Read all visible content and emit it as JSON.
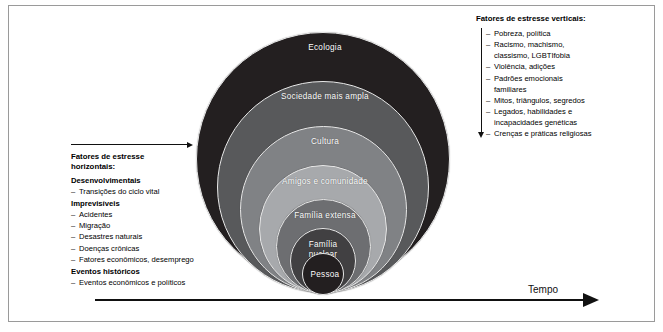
{
  "figure": {
    "rings": [
      {
        "id": "ecologia",
        "label": "Ecologia",
        "color": "#231f20"
      },
      {
        "id": "sociedade-mais-ampla",
        "label": "Sociedade mais ampla",
        "color": "#58595b"
      },
      {
        "id": "cultura",
        "label": "Cultura",
        "color": "#808285"
      },
      {
        "id": "amigos-e-comunidade",
        "label": "Amigos e comunidade",
        "color": "#a7a9ac"
      },
      {
        "id": "familia-extensa",
        "label": "Família extensa",
        "color": "#6d6e71"
      },
      {
        "id": "familia-nuclear",
        "label": "Família nuclear",
        "color": "#414042"
      },
      {
        "id": "pessoa",
        "label": "Pessoa",
        "color": "#231f20"
      }
    ],
    "time_axis": {
      "label": "Tempo"
    }
  },
  "vertical_stressors": {
    "title": "Fatores de estresse verticais:",
    "items": [
      "Pobreza, política",
      "Racismo, machismo, classismo,  LGBTIfobia",
      "Violência, adições",
      "Padrões emocionais familiares",
      "Mitos, triângulos, segredos",
      "Legados, habilidades e incapacidades genéticas",
      "Crenças e práticas religiosas"
    ]
  },
  "horizontal_stressors": {
    "title_line1": "Fatores de estresse",
    "title_line2": "horizontais:",
    "groups": [
      {
        "heading": "Desenvolvimentais",
        "items": [
          "Transições do ciclo vital"
        ]
      },
      {
        "heading": "Imprevisíveis",
        "items": [
          "Acidentes",
          "Migração",
          "Desastres naturais",
          "Doenças crônicas",
          "Fatores econômicos, desemprego"
        ]
      },
      {
        "heading": "Eventos históricos",
        "items": [
          "Eventos econômicos e políticos"
        ]
      }
    ]
  }
}
